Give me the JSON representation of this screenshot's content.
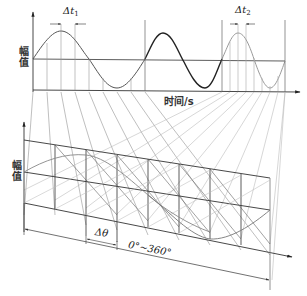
{
  "diagram": {
    "top_panel": {
      "y_axis_label": "幅值",
      "x_axis_label": "时间/s",
      "delta_t1": {
        "symbol": "Δt",
        "subscript": "1"
      },
      "delta_t2": {
        "symbol": "Δt",
        "subscript": "2"
      }
    },
    "bottom_panel": {
      "y_axis_label": "幅值",
      "delta_theta": "Δθ",
      "range_label": "0°~360°"
    },
    "colors": {
      "line_dark": "#333333",
      "line_light": "#9a9a9a",
      "projection": "#b0b0b0"
    }
  }
}
